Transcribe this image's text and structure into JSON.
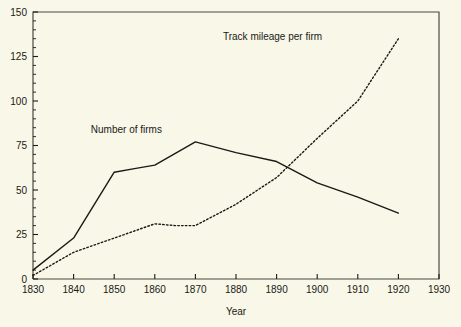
{
  "chart_data": {
    "type": "line",
    "title": "",
    "xlabel": "Year",
    "ylabel": "",
    "xlim": [
      1830,
      1930
    ],
    "ylim": [
      0,
      150
    ],
    "xticks": [
      1830,
      1840,
      1850,
      1860,
      1870,
      1880,
      1890,
      1900,
      1910,
      1920,
      1930
    ],
    "xtick_labels": [
      "1830",
      "1840",
      "1850",
      "1860",
      "1870",
      "1880",
      "1890",
      "1900",
      "1910",
      "1920",
      "1930"
    ],
    "yticks": [
      0,
      25,
      50,
      75,
      100,
      125,
      150
    ],
    "ytick_labels": [
      "0",
      "25",
      "50",
      "75",
      "100",
      "125",
      "150"
    ],
    "minor_ticks": true,
    "grid": false,
    "legend_position": "inline-annotation",
    "series": [
      {
        "name": "Number of firms",
        "style": "solid",
        "color": "#1a1a16",
        "label_x": 1853,
        "label_y": 82,
        "x": [
          1830,
          1840,
          1850,
          1855,
          1860,
          1870,
          1880,
          1890,
          1900,
          1910,
          1920
        ],
        "values": [
          5,
          23,
          60,
          62,
          64,
          77,
          71,
          66,
          54,
          46,
          37
        ]
      },
      {
        "name": "Track mileage per firm",
        "style": "dotted",
        "color": "#1a1a16",
        "label_x": 1889,
        "label_y": 134,
        "x": [
          1830,
          1840,
          1850,
          1860,
          1865,
          1870,
          1880,
          1890,
          1900,
          1910,
          1920
        ],
        "values": [
          2,
          15,
          23,
          31,
          30,
          30,
          42,
          57,
          79,
          100,
          135
        ]
      }
    ],
    "annotations": [
      {
        "text": "Number of firms",
        "x": 1853,
        "y": 82
      },
      {
        "text": "Track mileage per firm",
        "x": 1889,
        "y": 134
      }
    ]
  },
  "axis": {
    "x_title": "Year"
  },
  "colors": {
    "background": "#f8f7e8",
    "ink": "#1a1a16",
    "frame": "#4a4a42"
  }
}
